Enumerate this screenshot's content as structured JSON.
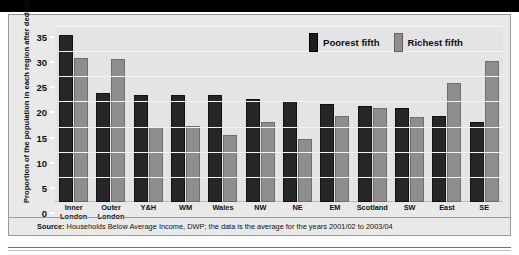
{
  "chart_data": {
    "type": "bar",
    "title": "",
    "xlabel": "",
    "ylabel": "Proportion of the population in each region after deducting housing costs (per cent)",
    "ylim": [
      0,
      35
    ],
    "yticks": [
      0,
      5,
      10,
      15,
      20,
      25,
      30,
      35
    ],
    "grid": true,
    "legend_position": "top-right",
    "categories": [
      "Inner London",
      "Outer London",
      "Y&H",
      "WM",
      "Wales",
      "NW",
      "NE",
      "EM",
      "Scotland",
      "SW",
      "East",
      "SE"
    ],
    "series": [
      {
        "name": "Poorest fifth",
        "color": "#262626",
        "values": [
          33.2,
          21.6,
          21.3,
          21.3,
          21.2,
          20.4,
          20.1,
          19.5,
          19.0,
          18.7,
          17.2,
          16.0
        ]
      },
      {
        "name": "Richest fifth",
        "color": "#8e8e8e",
        "values": [
          28.6,
          28.4,
          14.9,
          15.2,
          13.3,
          16.0,
          12.6,
          17.2,
          18.6,
          17.0,
          23.7,
          28.0
        ]
      }
    ],
    "source": "Households Below Average Income, DWP; the data is the average for the years 2001/02 to 2003/04"
  },
  "legend": {
    "items": [
      {
        "label": "Poorest fifth",
        "swatch": "poorest-fifth-swatch"
      },
      {
        "label": "Richest fifth",
        "swatch": "richest-fifth-swatch"
      }
    ]
  },
  "footer": {
    "source_prefix": "Source",
    "source_separator": ": ",
    "source_text": "Households Below Average Income, DWP; the data is the average for the years 2001/02 to 2003/04"
  }
}
